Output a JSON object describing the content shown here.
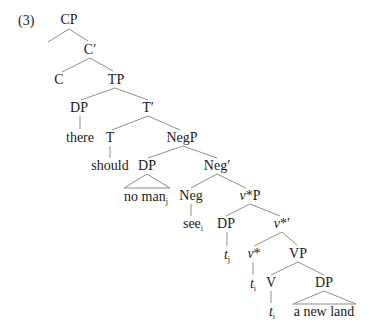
{
  "example_number": "(3)",
  "nodes": {
    "CP": {
      "label": "CP"
    },
    "C_bar": {
      "label": "C′"
    },
    "C": {
      "label": "C"
    },
    "TP": {
      "label": "TP"
    },
    "DP_spec_T": {
      "label": "DP"
    },
    "there": {
      "label": "there"
    },
    "T_bar": {
      "label": "T′"
    },
    "T": {
      "label": "T"
    },
    "should": {
      "label": "should"
    },
    "NegP": {
      "label": "NegP"
    },
    "DP_spec_Neg": {
      "label": "DP"
    },
    "no_man": {
      "label": "no man",
      "sub": "j"
    },
    "Neg_bar": {
      "label": "Neg′"
    },
    "Neg": {
      "label": "Neg"
    },
    "see": {
      "label": "see",
      "sub": "i"
    },
    "vP": {
      "label": "v",
      "suffix": "*P"
    },
    "DP_spec_v": {
      "label": "DP"
    },
    "t_j": {
      "label": "t",
      "sub": "j"
    },
    "v_bar": {
      "label": "v",
      "suffix": "*′"
    },
    "v_head": {
      "label": "v",
      "suffix": "*"
    },
    "t_i_v": {
      "label": "t",
      "sub": "i"
    },
    "VP": {
      "label": "VP"
    },
    "V": {
      "label": "V"
    },
    "t_i_V": {
      "label": "t",
      "sub": "i"
    },
    "DP_obj": {
      "label": "DP"
    },
    "a_new_land": {
      "label": "a new land"
    }
  }
}
